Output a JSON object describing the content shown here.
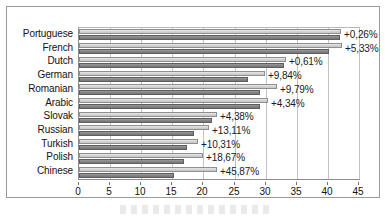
{
  "chart_data": {
    "type": "bar",
    "orientation": "horizontal",
    "title": "",
    "xlabel": "",
    "ylabel": "",
    "xlim": [
      0,
      45
    ],
    "xticks": [
      0,
      5,
      10,
      15,
      20,
      25,
      30,
      35,
      40,
      45
    ],
    "xtick_labels": [
      "0",
      "5",
      "10",
      "15",
      "20",
      "25",
      "30",
      "35",
      "40",
      "45"
    ],
    "grid": true,
    "grid_axis": "x",
    "legend": "none",
    "categories": [
      "Portuguese",
      "French",
      "Dutch",
      "German",
      "Romanian",
      "Arabic",
      "Slovak",
      "Russian",
      "Turkish",
      "Polish",
      "Chinese"
    ],
    "series": [
      {
        "name": "light-bar",
        "color": "#d6d6d6",
        "values": [
          42.1,
          42.3,
          33.2,
          29.9,
          31.9,
          30.4,
          22.2,
          20.9,
          19.1,
          20.0,
          22.2
        ]
      },
      {
        "name": "dark-bar",
        "color": "#868686",
        "values": [
          42.0,
          40.1,
          33.0,
          27.2,
          29.1,
          29.1,
          21.3,
          18.5,
          17.3,
          16.9,
          15.2
        ]
      }
    ],
    "annotations": [
      "+0,26%",
      "+5,33%",
      "+0,61%",
      "+9,84%",
      "+9,79%",
      "+4,34%",
      "+4,38%",
      "+13,11%",
      "+10,31%",
      "+18,67%",
      "+45,87%"
    ]
  }
}
